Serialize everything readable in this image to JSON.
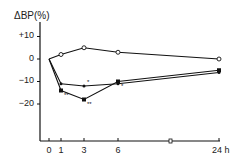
{
  "chart_data": {
    "type": "line",
    "title": "",
    "ylabel": "ΔBP(%)",
    "xlabel": "",
    "x_unit": "h",
    "x": [
      0,
      1,
      3,
      6,
      24
    ],
    "x_tick_labels": [
      "0",
      "1",
      "3",
      "6",
      "24 h"
    ],
    "y_tick_labels": [
      "+10",
      "0",
      "−10",
      "−20"
    ],
    "y_ticks": [
      10,
      0,
      -10,
      -20
    ],
    "ylim": [
      -38,
      14
    ],
    "grid": false,
    "legend": "none",
    "axis_break_x": "between 6 and 24 h",
    "series": [
      {
        "name": "control (open circles)",
        "marker": "open-circle",
        "values": [
          0,
          2,
          5,
          3,
          0
        ],
        "annotations": [
          "",
          "",
          "",
          "",
          ""
        ]
      },
      {
        "name": "treatment A (filled squares)",
        "marker": "filled-square",
        "values": [
          0,
          -14,
          -18,
          -10,
          -5
        ],
        "annotations": [
          "",
          "**",
          "**",
          "*",
          ""
        ]
      },
      {
        "name": "treatment B (filled dots)",
        "marker": "filled-dot",
        "values": [
          0,
          -11,
          -12,
          -11,
          -6
        ],
        "annotations": [
          "",
          "",
          "*",
          "",
          ""
        ]
      }
    ]
  },
  "labels": {
    "ylabel": "ΔBP(%)",
    "y10": "+10",
    "y0": "0",
    "ym10": "−10",
    "ym20": "−20",
    "x0": "0",
    "x1": "1",
    "x3": "3",
    "x6": "6",
    "x24": "24 h"
  }
}
